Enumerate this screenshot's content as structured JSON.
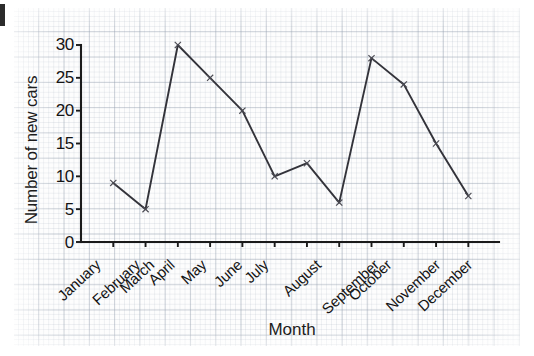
{
  "chart_data": {
    "type": "line",
    "title": "",
    "xlabel": "Month",
    "ylabel": "Number of new cars",
    "categories": [
      "January",
      "February",
      "March",
      "April",
      "May",
      "June",
      "July",
      "August",
      "September",
      "October",
      "November",
      "December"
    ],
    "values": [
      9,
      5,
      30,
      25,
      20,
      10,
      12,
      6,
      28,
      24,
      15,
      7
    ],
    "series": [
      {
        "name": "Number of new cars",
        "values": [
          9,
          5,
          30,
          25,
          20,
          10,
          12,
          6,
          28,
          24,
          15,
          7
        ]
      }
    ],
    "ylim": [
      0,
      30
    ],
    "yticks": [
      0,
      5,
      10,
      15,
      20,
      25,
      30
    ],
    "ytick_labels": [
      "0",
      "5",
      "10",
      "15",
      "20",
      "25",
      "30"
    ],
    "grid": true,
    "grid_style": "graph-paper",
    "legend": false,
    "legend_position": "none",
    "marker": "x",
    "line_color": "#33333a",
    "marker_color": "#4a4a52",
    "axis_color": "#1a1a1a",
    "grid_color": "#96a0af",
    "background": "#fdfdfd",
    "annotations": []
  },
  "axes": {
    "y_tick_labels": [
      "30",
      "25",
      "20",
      "15",
      "10",
      "5",
      "0"
    ],
    "x_tick_labels": [
      "January",
      "February",
      "March",
      "April",
      "May",
      "June",
      "July",
      "August",
      "September",
      "October",
      "November",
      "December"
    ],
    "y_axis_title": "Number of new cars",
    "x_axis_title": "Month"
  },
  "marks": {
    "corner_fragment": ""
  }
}
